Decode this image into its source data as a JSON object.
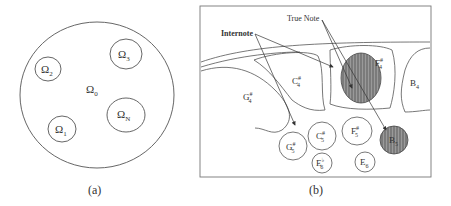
{
  "figure": {
    "panel_a": {
      "caption": "(a)",
      "outer_domain_label": "Ω",
      "outer_domain_sub": "0",
      "subdomains": [
        {
          "id": "omega-2",
          "label": "Ω",
          "sub": "2"
        },
        {
          "id": "omega-3",
          "label": "Ω",
          "sub": "3"
        },
        {
          "id": "omega-1",
          "label": "Ω",
          "sub": "1"
        },
        {
          "id": "omega-n",
          "label": "Ω",
          "sub": "N"
        }
      ]
    },
    "panel_b": {
      "caption": "(b)",
      "annotations": {
        "internote": "Internote",
        "true_note": "True Note"
      },
      "regions": [
        {
          "id": "g4sharp",
          "note": "G",
          "sup": "#",
          "sub": "4"
        },
        {
          "id": "c4sharp",
          "note": "C",
          "sup": "#",
          "sub": "4"
        },
        {
          "id": "f4sharp",
          "note": "F",
          "sup": "#",
          "sub": "4",
          "true_note": true
        },
        {
          "id": "b4",
          "note": "B",
          "sup": "",
          "sub": "4"
        }
      ],
      "circles": [
        {
          "id": "g5sharp",
          "note": "G",
          "sup": "#",
          "sub": "5"
        },
        {
          "id": "c5sharp",
          "note": "C",
          "sup": "#",
          "sub": "5"
        },
        {
          "id": "f5sharp",
          "note": "F",
          "sup": "#",
          "sub": "5"
        },
        {
          "id": "b5",
          "note": "B",
          "sup": "",
          "sub": "5",
          "true_note": true
        },
        {
          "id": "e6flat",
          "note": "E",
          "sup": "♭",
          "sub": "6"
        },
        {
          "id": "e6",
          "note": "E",
          "sup": "",
          "sub": "6"
        }
      ]
    }
  }
}
